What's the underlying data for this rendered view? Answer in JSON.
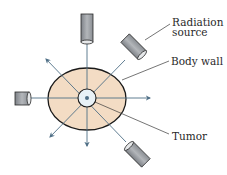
{
  "diagram": {
    "labels": {
      "radiation_source_line1": "Radiation",
      "radiation_source_line2": "source",
      "body_wall": "Body wall",
      "tumor": "Tumor"
    },
    "colors": {
      "body_fill": "#f3dcc4",
      "body_outline": "#1a1a1a",
      "tumor_fill": "#e8f1f6",
      "beam": "#4f6f86",
      "source_fill": "#9a9ea3",
      "leader_line": "#3a3a3a"
    },
    "elements": {
      "radiation_sources": 4,
      "exit_arrows": 4
    }
  }
}
